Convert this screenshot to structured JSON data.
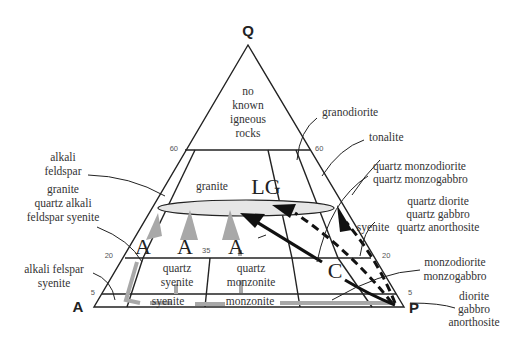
{
  "diagram": {
    "vertices": {
      "top": "Q",
      "left": "A",
      "right": "P"
    },
    "ticks": {
      "q60_left": "60",
      "q60_right": "60",
      "q20_left": "20",
      "q20_right": "20",
      "q5_left": "5",
      "q5_right": "5",
      "split35": "35"
    },
    "fields_inside": {
      "no_known": [
        "no",
        "known",
        "igneous",
        "rocks"
      ],
      "granite": "granite",
      "quartz_syenite": [
        "quartz",
        "syenite"
      ],
      "quartz_monzonite": [
        "quartz",
        "monzonite"
      ],
      "syenite": "syenite",
      "monzonite": "monzonite"
    },
    "labels_outside": {
      "alkali_feldspar": [
        "alkali",
        "feldspar"
      ],
      "granite_qafs": [
        "granite",
        "quartz alkali",
        "feldspar syenite"
      ],
      "alkali_felspar_syenite": [
        "alkali felspar",
        "syenite"
      ],
      "granodiorite": "granodiorite",
      "tonalite": "tonalite",
      "quartz_monzodiorite": [
        "quartz monzodiorite",
        "quartz monzogabbro"
      ],
      "quartz_diorite": [
        "quartz diorite",
        "quartz gabbro",
        "quartz anorthosite"
      ],
      "syenite_right": "syenite",
      "monzodiorite": [
        "monzodiorite",
        "monzogabbro"
      ],
      "diorite": [
        "diorite",
        "gabbro",
        "anorthosite"
      ]
    },
    "trend_labels": {
      "lg": "LG",
      "a1": "A",
      "a2": "A",
      "a3": "A",
      "c": "C"
    },
    "colors": {
      "line": "#222222",
      "gray_arrow": "#a8a8a8",
      "ellipse_fill": "#e6e6e6"
    }
  }
}
